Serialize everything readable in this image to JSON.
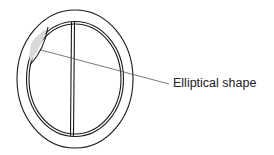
{
  "diagram": {
    "type": "valve cross-section schematic",
    "callouts": [
      {
        "id": "elliptical-shape",
        "label": "Elliptical shape"
      }
    ],
    "colors": {
      "stroke": "#1a1a1a",
      "shaded_region": "#d9d9d9",
      "leader_line": "#555555",
      "background": "#ffffff"
    }
  }
}
